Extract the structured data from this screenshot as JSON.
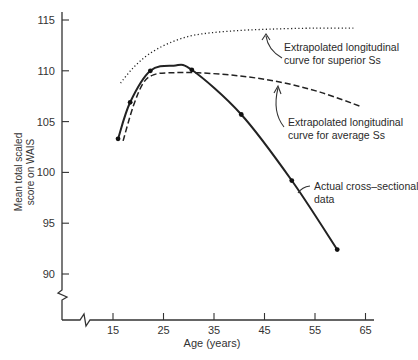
{
  "chart_data": {
    "type": "line",
    "title": "",
    "xlabel": "Age (years)",
    "ylabel": [
      "Mean total scaled",
      "score on WAIS"
    ],
    "xlim": [
      15,
      65
    ],
    "ylim": [
      90,
      115
    ],
    "x_ticks": [
      15,
      25,
      35,
      45,
      55,
      65
    ],
    "y_ticks": [
      90,
      95,
      100,
      105,
      110,
      115
    ],
    "grid": false,
    "axis_breaks": [
      "y-axis below 90",
      "x-axis below 15"
    ],
    "series": [
      {
        "name": "Actual cross-sectional data",
        "style": "solid",
        "markers": true,
        "points": [
          [
            16,
            103.3
          ],
          [
            18.4,
            106.9
          ],
          [
            22.4,
            110.0
          ],
          [
            27,
            110.5
          ],
          [
            30.6,
            110.1
          ],
          [
            40.4,
            105.7
          ],
          [
            50.4,
            99.2
          ],
          [
            59.4,
            92.4
          ]
        ],
        "marker_points": [
          [
            16,
            103.3
          ],
          [
            18.4,
            106.9
          ],
          [
            22.4,
            110.0
          ],
          [
            30.6,
            110.1
          ],
          [
            40.4,
            105.7
          ],
          [
            50.4,
            99.2
          ],
          [
            59.4,
            92.4
          ]
        ]
      },
      {
        "name": "Extrapolated longitudinal curve for average Ss",
        "style": "dashed",
        "markers": false,
        "points": [
          [
            17,
            103.1
          ],
          [
            19,
            106.5
          ],
          [
            21,
            108.8
          ],
          [
            23,
            109.6
          ],
          [
            26,
            109.8
          ],
          [
            32,
            109.8
          ],
          [
            40,
            109.5
          ],
          [
            48,
            108.9
          ],
          [
            56,
            107.9
          ],
          [
            64,
            106.5
          ]
        ]
      },
      {
        "name": "Extrapolated longitudinal curve for superior Ss",
        "style": "dotted",
        "markers": false,
        "points": [
          [
            16.5,
            108.8
          ],
          [
            19,
            110.3
          ],
          [
            22,
            111.6
          ],
          [
            26,
            112.7
          ],
          [
            31,
            113.5
          ],
          [
            38,
            113.9
          ],
          [
            46,
            114.1
          ],
          [
            55,
            114.2
          ],
          [
            62.6,
            114.2
          ]
        ]
      }
    ],
    "annotations": [
      {
        "lines": [
          "Extrapolated longitudinal",
          "curve for superior Ss"
        ],
        "target_series": "superior"
      },
      {
        "lines": [
          "Extrapolated longitudinal",
          "curve for average Ss"
        ],
        "target_series": "average"
      },
      {
        "lines": [
          "Actual cross–sectional",
          "data"
        ],
        "target_series": "actual"
      }
    ],
    "legend": "none (inline annotations with arrows)"
  }
}
